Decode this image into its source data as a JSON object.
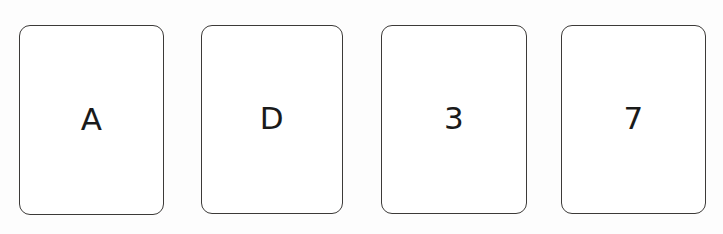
{
  "board": {
    "name": "card-row",
    "background_color": "#fdfdfd",
    "card_count": 4
  },
  "style": {
    "card_background": "#ffffff",
    "card_border_color": "#3c3a38",
    "text_color": "#1a1a1a"
  },
  "cards": [
    {
      "id": "card-1",
      "face": "A",
      "kind": "letter"
    },
    {
      "id": "card-2",
      "face": "D",
      "kind": "letter"
    },
    {
      "id": "card-3",
      "face": "3",
      "kind": "number"
    },
    {
      "id": "card-4",
      "face": "7",
      "kind": "number"
    }
  ]
}
